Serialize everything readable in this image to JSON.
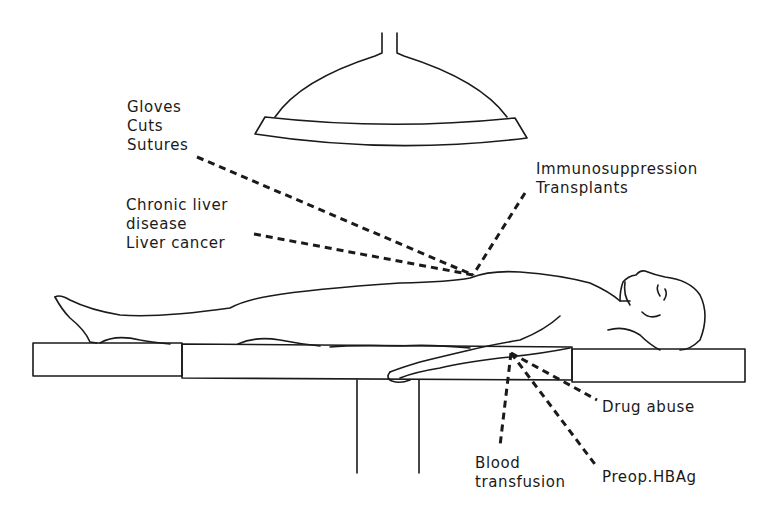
{
  "diagram": {
    "labels": {
      "surgery": [
        "Gloves",
        "Cuts",
        "Sutures"
      ],
      "liver": [
        "Chronic liver",
        "disease",
        "Liver cancer"
      ],
      "immuno": [
        "Immunosuppression",
        "Transplants"
      ],
      "drug": [
        "Drug abuse"
      ],
      "blood": [
        "Blood",
        "transfusion"
      ],
      "preop": [
        "Preop.HBAg"
      ]
    },
    "icons": {
      "lamp": "surgical-lamp-icon",
      "patient": "patient-figure-icon",
      "table": "operating-table-icon"
    },
    "colors": {
      "ink": "#1a1a1a",
      "background": "#ffffff"
    }
  }
}
